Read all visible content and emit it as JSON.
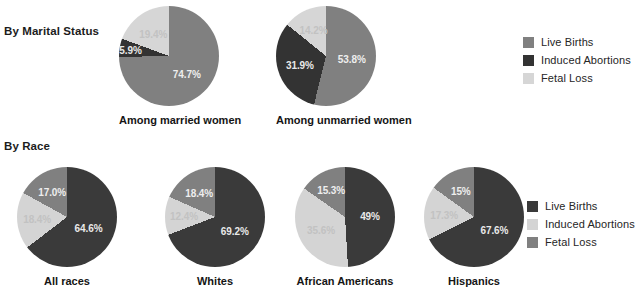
{
  "colors": {
    "live_births_top": "#808080",
    "induced_abortions_top": "#333333",
    "fetal_loss_top": "#d6d6d6",
    "live_births_bottom": "#3a3a3a",
    "induced_abortions_bottom": "#d4d4d4",
    "fetal_loss_bottom": "#808080",
    "background": "#ffffff",
    "text": "#1a1a1a"
  },
  "sections": {
    "marital": {
      "title": "By Marital Status"
    },
    "race": {
      "title": "By Race"
    }
  },
  "legends": {
    "top": {
      "items": [
        {
          "label": "Live Births",
          "color": "#808080",
          "swatch": "legend-swatch-live-births"
        },
        {
          "label": "Induced Abortions",
          "color": "#333333",
          "swatch": "legend-swatch-induced-abortions"
        },
        {
          "label": "Fetal Loss",
          "color": "#d6d6d6",
          "swatch": "legend-swatch-fetal-loss"
        }
      ]
    },
    "bottom": {
      "items": [
        {
          "label": "Live Births",
          "color": "#3a3a3a",
          "swatch": "legend-swatch-live-births"
        },
        {
          "label": "Induced Abortions",
          "color": "#d4d4d4",
          "swatch": "legend-swatch-induced-abortions"
        },
        {
          "label": "Fetal Loss",
          "color": "#808080",
          "swatch": "legend-swatch-fetal-loss"
        }
      ]
    }
  },
  "chart_data": [
    {
      "type": "pie",
      "title": "Among married women",
      "categories": [
        "Live Births",
        "Induced Abortions",
        "Fetal Loss"
      ],
      "values": [
        74.7,
        5.9,
        19.4
      ],
      "labels": [
        "74.7%",
        "5.9%",
        "19.4%"
      ],
      "colors": [
        "#808080",
        "#333333",
        "#d6d6d6"
      ],
      "unit": "percent",
      "legend": "top"
    },
    {
      "type": "pie",
      "title": "Among unmarried women",
      "categories": [
        "Live Births",
        "Induced Abortions",
        "Fetal Loss"
      ],
      "values": [
        53.8,
        31.9,
        14.2
      ],
      "labels": [
        "53.8%",
        "31.9%",
        "14.2%"
      ],
      "colors": [
        "#808080",
        "#333333",
        "#d6d6d6"
      ],
      "unit": "percent",
      "legend": "top"
    },
    {
      "type": "pie",
      "title": "All races",
      "categories": [
        "Live Births",
        "Induced Abortions",
        "Fetal Loss"
      ],
      "values": [
        64.6,
        18.4,
        17.0
      ],
      "labels": [
        "64.6%",
        "18.4%",
        "17.0%"
      ],
      "colors": [
        "#3a3a3a",
        "#d4d4d4",
        "#808080"
      ],
      "unit": "percent",
      "legend": "bottom"
    },
    {
      "type": "pie",
      "title": "Whites",
      "categories": [
        "Live Births",
        "Induced Abortions",
        "Fetal Loss"
      ],
      "values": [
        69.2,
        12.4,
        18.4
      ],
      "labels": [
        "69.2%",
        "12.4%",
        "18.4%"
      ],
      "colors": [
        "#3a3a3a",
        "#d4d4d4",
        "#808080"
      ],
      "unit": "percent",
      "legend": "bottom"
    },
    {
      "type": "pie",
      "title": "African Americans",
      "categories": [
        "Live Births",
        "Induced Abortions",
        "Fetal Loss"
      ],
      "values": [
        49.0,
        35.6,
        15.3
      ],
      "labels": [
        "49%",
        "35.6%",
        "15.3%"
      ],
      "colors": [
        "#3a3a3a",
        "#d4d4d4",
        "#808080"
      ],
      "unit": "percent",
      "legend": "bottom"
    },
    {
      "type": "pie",
      "title": "Hispanics",
      "categories": [
        "Live Births",
        "Induced Abortions",
        "Fetal Loss"
      ],
      "values": [
        67.6,
        17.3,
        15.0
      ],
      "labels": [
        "67.6%",
        "17.3%",
        "15%"
      ],
      "colors": [
        "#3a3a3a",
        "#d4d4d4",
        "#808080"
      ],
      "unit": "percent",
      "legend": "bottom"
    }
  ]
}
